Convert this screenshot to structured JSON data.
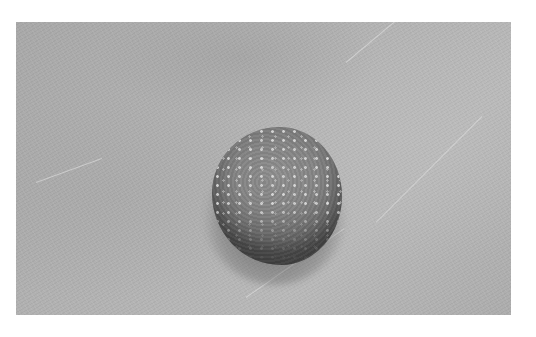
{
  "image": {
    "kind": "photograph",
    "mode": "grayscale",
    "subject": "raised round skin lesion with bumpy, speckled surface on textured background",
    "frame": {
      "left": 16,
      "top": 22,
      "width": 495,
      "height": 293
    },
    "colors": {
      "page_background": "#ffffff",
      "photo_background": "#b1b1b1",
      "lesion_body": "#858585",
      "lesion_shadow": "#4a4a4a",
      "highlight_speckles": "#e1e1e1"
    },
    "lesion": {
      "center_x": 261,
      "center_y": 174,
      "width": 130,
      "height": 138
    }
  }
}
